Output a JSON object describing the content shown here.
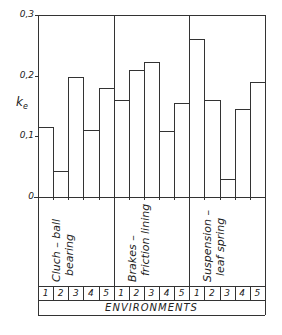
{
  "chart_data": {
    "type": "bar",
    "title": "",
    "xlabel": "ENVIRONMENTS",
    "ylabel": "k_e",
    "ylim": [
      0,
      0.3
    ],
    "yticks": [
      "0",
      "0,1",
      "0,2",
      "0,3"
    ],
    "grid": false,
    "categories": [
      "1",
      "2",
      "3",
      "4",
      "5"
    ],
    "series": [
      {
        "name": "Cluch-ball bearing",
        "values": [
          0.115,
          0.043,
          0.197,
          0.11,
          0.18
        ]
      },
      {
        "name": "Brakes-friction lining",
        "values": [
          0.16,
          0.21,
          0.223,
          0.108,
          0.155
        ]
      },
      {
        "name": "Suspension-leaf spring",
        "values": [
          0.26,
          0.16,
          0.03,
          0.145,
          0.19
        ]
      }
    ]
  },
  "axis": {
    "ylabel_main": "k",
    "ylabel_sub": "e"
  },
  "groups": [
    {
      "line1": "Cluch – ball",
      "line2": "bearing"
    },
    {
      "line1": "Brakes –",
      "line2": "friction  lining"
    },
    {
      "line1": "Suspension –",
      "line2": "leaf  spring"
    }
  ],
  "env_numbers": [
    "1",
    "2",
    "3",
    "4",
    "5"
  ],
  "env_title": "ENVIRONMENTS"
}
